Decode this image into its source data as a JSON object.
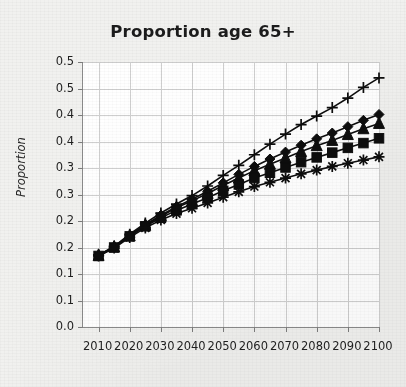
{
  "figure": {
    "background_color": "#f1f1ef",
    "plot_background_color": "#ffffff",
    "axis_color": "#8a8a8a",
    "grid_color": "#cfcfcf",
    "series_color": "#0d0d0d"
  },
  "chart_data": {
    "type": "line",
    "title": "Proportion age 65+",
    "xlabel": "",
    "ylabel": "Proportion",
    "x": [
      2010,
      2015,
      2020,
      2025,
      2030,
      2035,
      2040,
      2045,
      2050,
      2055,
      2060,
      2065,
      2070,
      2075,
      2080,
      2085,
      2090,
      2095,
      2100
    ],
    "xlim": [
      2005,
      2100
    ],
    "ylim": [
      0.0,
      0.5
    ],
    "xticks": [
      2010,
      2020,
      2030,
      2040,
      2050,
      2060,
      2070,
      2080,
      2090,
      2100
    ],
    "xtick_labels": [
      "2010",
      "2020",
      "2030",
      "2040",
      "2050",
      "2060",
      "2070",
      "2080",
      "2090",
      "2100"
    ],
    "yticks": [
      0.5,
      0.45,
      0.4,
      0.35,
      0.3,
      0.25,
      0.2,
      0.15,
      0.1,
      0.05,
      0.0
    ],
    "ytick_labels": [
      "0.5",
      "0.5",
      "0.4",
      "0.4",
      "0.3",
      "0.3",
      "0.2",
      "0.2",
      "0.1",
      "0.1",
      "0.0"
    ],
    "grid": true,
    "legend": "none",
    "marker_interval_years": 5,
    "series": [
      {
        "name": "series-plus",
        "marker": "plus",
        "values": [
          0.136,
          0.152,
          0.175,
          0.196,
          0.215,
          0.232,
          0.248,
          0.266,
          0.286,
          0.305,
          0.325,
          0.345,
          0.364,
          0.382,
          0.398,
          0.414,
          0.432,
          0.452,
          0.47
        ]
      },
      {
        "name": "series-diamond",
        "marker": "diamond",
        "values": [
          0.135,
          0.151,
          0.173,
          0.193,
          0.211,
          0.227,
          0.241,
          0.256,
          0.272,
          0.288,
          0.303,
          0.317,
          0.33,
          0.343,
          0.355,
          0.366,
          0.378,
          0.39,
          0.401
        ]
      },
      {
        "name": "series-triangle",
        "marker": "triangle",
        "values": [
          0.135,
          0.151,
          0.172,
          0.192,
          0.209,
          0.225,
          0.238,
          0.252,
          0.267,
          0.281,
          0.295,
          0.307,
          0.319,
          0.331,
          0.342,
          0.352,
          0.363,
          0.374,
          0.384
        ]
      },
      {
        "name": "series-square",
        "marker": "square",
        "values": [
          0.134,
          0.15,
          0.171,
          0.19,
          0.206,
          0.22,
          0.232,
          0.244,
          0.257,
          0.269,
          0.281,
          0.291,
          0.301,
          0.311,
          0.32,
          0.329,
          0.338,
          0.347,
          0.356
        ]
      },
      {
        "name": "series-asterisk",
        "marker": "asterisk",
        "values": [
          0.134,
          0.149,
          0.169,
          0.187,
          0.202,
          0.214,
          0.224,
          0.234,
          0.245,
          0.255,
          0.265,
          0.273,
          0.281,
          0.289,
          0.296,
          0.303,
          0.309,
          0.315,
          0.321
        ]
      }
    ]
  }
}
